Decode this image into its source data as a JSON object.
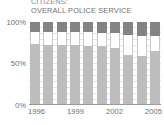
{
  "chart_data": {
    "type": "bar",
    "title": "CITIZENS:\nOVERALL POLICE SERVICE",
    "title_lines": [
      "CITIZENS:",
      "OVERALL POLICE SERVICE"
    ],
    "subtitle": "",
    "xlabel": "",
    "ylabel": "",
    "ylim": [
      0,
      100
    ],
    "grid": true,
    "stacked": true,
    "stack_total": 100,
    "legend_position": "none",
    "categories": [
      "1996",
      "1997",
      "1998",
      "1999",
      "2000",
      "2001",
      "2002",
      "2003",
      "2004",
      "2005"
    ],
    "x_tick_labels": [
      "1996",
      "1999",
      "2002",
      "2005"
    ],
    "x_tick_categories": [
      "1996",
      "1999",
      "2002",
      "2005"
    ],
    "y_tick_labels": [
      "100%",
      "50%",
      "0%"
    ],
    "y_tick_values": [
      100,
      50,
      0
    ],
    "series": [
      {
        "name": "top-segment",
        "color": "#838383",
        "values": [
          13,
          13,
          13,
          13,
          13,
          14,
          14,
          16,
          18,
          17
        ]
      },
      {
        "name": "middle-segment",
        "color": "#ffffff",
        "values": [
          14,
          15,
          15,
          15,
          16,
          16,
          18,
          24,
          23,
          19
        ]
      },
      {
        "name": "bottom-segment",
        "color": "#bdbdbd",
        "values": [
          73,
          72,
          72,
          72,
          71,
          70,
          68,
          60,
          59,
          64
        ]
      }
    ]
  },
  "colors": {
    "top": "#838383",
    "middle": "#ffffff",
    "bottom": "#bdbdbd",
    "axis": "#9a9a9a",
    "grid": "#e2e2e2",
    "text": "#6e6e6e",
    "background": "#ffffff"
  }
}
